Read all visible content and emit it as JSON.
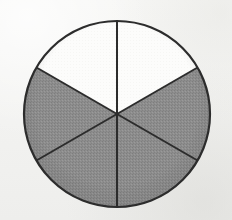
{
  "figure": {
    "kind": "fraction-circle",
    "caption": "",
    "width": 232,
    "height": 220,
    "background_color": "#f4f4f2"
  },
  "chart_data": {
    "type": "pie",
    "title": "",
    "subtitle": "",
    "xlabel": "",
    "ylabel": "",
    "legend": [],
    "legend_position": "none",
    "grid": false,
    "labels_shown": false,
    "total_sectors": 6,
    "shaded_sectors": 4,
    "unshaded_sectors": 2,
    "fraction_shaded": "4/6",
    "sector_sweep_degrees": 60,
    "categories": [
      "sector-1-top-right",
      "sector-2-right",
      "sector-3-bottom-right",
      "sector-4-bottom-left",
      "sector-5-left",
      "sector-6-top-left"
    ],
    "values": [
      1,
      1,
      1,
      1,
      1,
      1
    ],
    "states": [
      "unshaded",
      "shaded",
      "shaded",
      "shaded",
      "shaded",
      "unshaded"
    ],
    "start_angles_deg": [
      -90,
      -30,
      30,
      90,
      150,
      210
    ],
    "end_angles_deg": [
      -30,
      30,
      90,
      150,
      210,
      270
    ],
    "geometry": {
      "center_x": 117,
      "center_y": 114,
      "radius": 93
    },
    "colors": {
      "shaded_fill": "#8b8b8b",
      "unshaded_fill": "#fcfcfb",
      "stroke": "#2c2c2c",
      "background": "#f4f4f2"
    },
    "stroke_width": 2
  }
}
